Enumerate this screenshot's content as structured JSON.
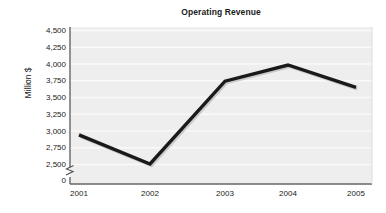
{
  "chart_data": {
    "type": "line",
    "title": "Operating Revenue",
    "xlabel": "",
    "ylabel": "Million $",
    "categories": [
      "2001",
      "2002",
      "2003",
      "2004",
      "2005"
    ],
    "values": [
      3140,
      2760,
      3840,
      4050,
      3760
    ],
    "series": [
      {
        "name": "Operating Revenue",
        "values": [
          3140,
          2760,
          3840,
          4050,
          3760
        ],
        "color": "#1a1a1a"
      }
    ],
    "ylim": [
      2500,
      4500
    ],
    "y_ticks": [
      "0",
      "2,500",
      "2,750",
      "3,000",
      "3,250",
      "3,500",
      "3,750",
      "4,000",
      "4,250",
      "4,500"
    ],
    "y_tick_values": [
      0,
      2500,
      2750,
      3000,
      3250,
      3500,
      3750,
      4000,
      4250,
      4500
    ],
    "x_ticks": [
      "2001",
      "2002",
      "2003",
      "2004",
      "2005"
    ],
    "grid": true,
    "grid_color": "#f7f7f7",
    "legend": "none",
    "axis_break": true,
    "axis_break_note": "y-axis broken between 0 and 2,500",
    "plot_background": "#eeeeee",
    "axis_color": "#555555",
    "line_color": "#1a1a1a",
    "text_color": "#1a1a1a"
  }
}
